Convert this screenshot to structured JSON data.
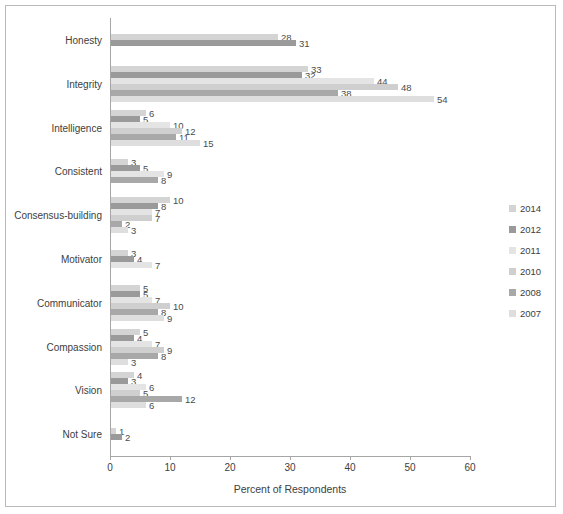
{
  "chart_data": {
    "type": "bar",
    "orientation": "horizontal",
    "title": "",
    "xlabel": "Percent of Respondents",
    "ylabel": "",
    "xlim": [
      0,
      60
    ],
    "xticks": [
      0,
      10,
      20,
      30,
      40,
      50,
      60
    ],
    "grid": false,
    "legend_position": "right",
    "categories": [
      "Honesty",
      "Integrity",
      "Intelligence",
      "Consistent",
      "Consensus-building",
      "Motivator",
      "Communicator",
      "Compassion",
      "Vision",
      "Not Sure"
    ],
    "series": [
      {
        "name": "2014",
        "color": "#d4d4d4",
        "values": [
          28,
          33,
          6,
          3,
          10,
          3,
          5,
          5,
          4,
          1
        ]
      },
      {
        "name": "2012",
        "color": "#9a9a9a",
        "values": [
          31,
          32,
          5,
          5,
          8,
          4,
          5,
          4,
          3,
          2
        ]
      },
      {
        "name": "2011",
        "color": "#e4e4e4",
        "values": [
          null,
          44,
          10,
          9,
          7,
          7,
          7,
          7,
          6,
          null
        ]
      },
      {
        "name": "2010",
        "color": "#cfcfcf",
        "values": [
          null,
          48,
          12,
          null,
          7,
          null,
          10,
          9,
          5,
          null
        ]
      },
      {
        "name": "2008",
        "color": "#a8a8a8",
        "values": [
          null,
          38,
          11,
          8,
          2,
          null,
          8,
          8,
          12,
          null
        ]
      },
      {
        "name": "2007",
        "color": "#dedede",
        "values": [
          null,
          54,
          15,
          null,
          3,
          null,
          9,
          3,
          6,
          null
        ]
      }
    ]
  },
  "legend": {
    "items": [
      {
        "label": "2014",
        "color": "#d4d4d4"
      },
      {
        "label": "2012",
        "color": "#9a9a9a"
      },
      {
        "label": "2011",
        "color": "#e4e4e4"
      },
      {
        "label": "2010",
        "color": "#cfcfcf"
      },
      {
        "label": "2008",
        "color": "#a8a8a8"
      },
      {
        "label": "2007",
        "color": "#dedede"
      }
    ]
  }
}
